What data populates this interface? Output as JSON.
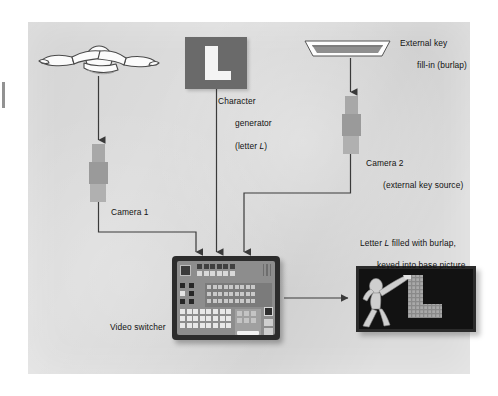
{
  "diagram": {
    "background_color": "#dcdcdc",
    "page_color": "#ffffff"
  },
  "nodes": {
    "dancer": {
      "name": "base-picture-dancer",
      "description": "outlined dancer figure (base picture source)",
      "label": ""
    },
    "character_generator": {
      "label_lines": [
        "Character",
        "generator",
        "(letter L)"
      ],
      "line1": "Character",
      "line2": "generator",
      "line3_prefix": "(letter ",
      "line3_italic": "L",
      "line3_suffix": ")",
      "card_letter": "L",
      "card_color": "#6a6a6a",
      "letter_color": "#f4f4f4"
    },
    "burlap": {
      "line1": "External key",
      "line2": "fill-in (burlap)",
      "swatch_color": "#8f8f8f"
    },
    "camera1": {
      "label": "Camera 1"
    },
    "camera2": {
      "line1": "Camera 2",
      "line2": "(external key source)"
    },
    "video_switcher": {
      "label": "Video switcher",
      "body_color": "#2c2c2c",
      "panel_color": "#8d8d8d"
    },
    "output_monitor": {
      "line1_prefix": "Letter ",
      "line1_italic": "L",
      "line1_suffix": " filled with burlap,",
      "line2": "keyed into base picture",
      "screen_color": "#1a1a1a",
      "letter_L": "L"
    }
  },
  "connections": [
    {
      "from": "dancer",
      "to": "camera1",
      "style": "arrow-down"
    },
    {
      "from": "camera1",
      "to": "video-switcher-input-1",
      "style": "elbow-arrow"
    },
    {
      "from": "character-generator",
      "to": "video-switcher-input-2",
      "style": "arrow-down"
    },
    {
      "from": "burlap",
      "to": "camera2",
      "style": "arrow-down"
    },
    {
      "from": "camera2",
      "to": "video-switcher-input-3",
      "style": "elbow-arrow"
    },
    {
      "from": "video-switcher",
      "to": "output-monitor",
      "style": "arrow-right"
    }
  ],
  "line_color": "#3a3a3a"
}
